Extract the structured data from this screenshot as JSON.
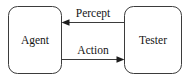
{
  "diagram": {
    "type": "block-flow-diagram",
    "background_color": "#ffffff",
    "line_color": "#3b3b3b",
    "text_color": "#151515",
    "nodes": [
      {
        "id": "agent",
        "label": "Agent",
        "shape": "rounded-rectangle",
        "x": 8,
        "y": 6,
        "width": 54,
        "height": 68,
        "corner_radius": 9
      },
      {
        "id": "tester",
        "label": "Tester",
        "shape": "rounded-rectangle",
        "x": 124,
        "y": 6,
        "width": 58,
        "height": 68,
        "corner_radius": 9
      }
    ],
    "edges": [
      {
        "id": "percept",
        "label": "Percept",
        "from": "tester",
        "to": "agent",
        "direction": "right-to-left",
        "y": 22,
        "x_start": 124,
        "x_end": 62,
        "arrowhead": "left",
        "label_x": 93,
        "label_y": 17
      },
      {
        "id": "action",
        "label": "Action",
        "from": "agent",
        "to": "tester",
        "direction": "left-to-right",
        "y": 59,
        "x_start": 62,
        "x_end": 124,
        "arrowhead": "right",
        "label_x": 93,
        "label_y": 53
      }
    ]
  }
}
